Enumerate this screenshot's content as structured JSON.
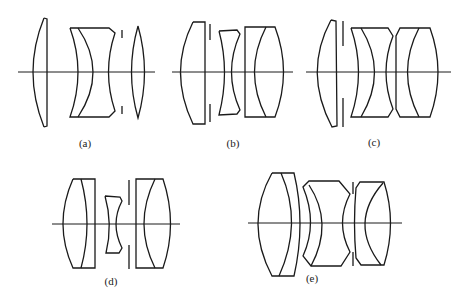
{
  "figure": {
    "type": "lens-diagram",
    "panels": [
      {
        "id": "a",
        "label": "(a)",
        "description": "Triplet-style: biconvex front element, cemented negative meniscus doublet, stop, biconvex rear element"
      },
      {
        "id": "b",
        "label": "(b)",
        "description": "Front positive element, stop, biconcave element, cemented rear doublet"
      },
      {
        "id": "c",
        "label": "(c)",
        "description": "Front positive element, stop, two cemented doublets"
      },
      {
        "id": "d",
        "label": "(d)",
        "description": "Cemented front doublet, small biconcave element, stop, cemented rear doublet"
      },
      {
        "id": "e",
        "label": "(e)",
        "description": "Cemented front doublet, cemented meniscus doublet, stop, cemented rear doublet"
      }
    ]
  },
  "colors": {
    "line": "#1a1a1a",
    "background": "#ffffff"
  }
}
